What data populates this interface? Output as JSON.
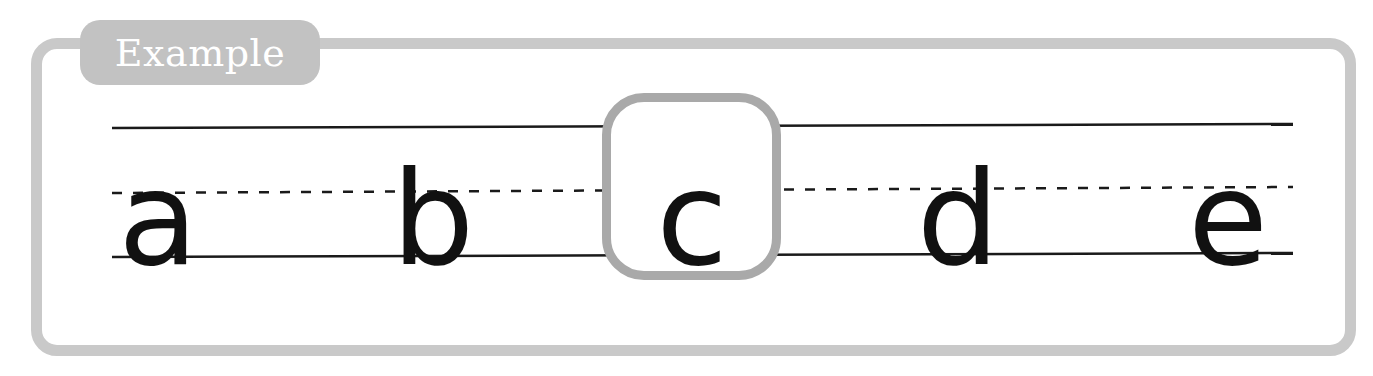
{
  "header": {
    "tab_label": "Example"
  },
  "worksheet": {
    "letters": [
      {
        "char": "a",
        "x": 158,
        "highlighted": false
      },
      {
        "char": "b",
        "x": 433,
        "highlighted": false
      },
      {
        "char": "c",
        "x": 692,
        "highlighted": true
      },
      {
        "char": "d",
        "x": 958,
        "highlighted": false
      },
      {
        "char": "e",
        "x": 1228,
        "highlighted": false
      }
    ],
    "colors": {
      "frame": "#c9c9c9",
      "tab": "#c2c2c2",
      "highlight_border": "#a9a9a9",
      "ink": "#111111"
    }
  }
}
